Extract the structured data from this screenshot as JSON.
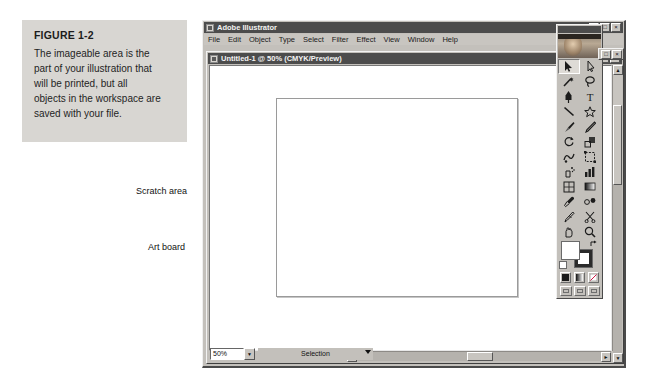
{
  "figure": {
    "title": "FIGURE 1-2",
    "lines": [
      "The imageable area is the",
      "part of your illustration that",
      "will be printed, but all",
      "objects in the workspace are",
      "saved with your file."
    ]
  },
  "callouts": {
    "scratch_area": "Scratch area",
    "art_board": "Art board"
  },
  "app_window": {
    "title": "Adobe Illustrator",
    "icon": "app-icon",
    "buttons": {
      "minimize": "_",
      "maximize": "□",
      "close": "×"
    },
    "menus": [
      "File",
      "Edit",
      "Object",
      "Type",
      "Select",
      "Filter",
      "Effect",
      "View",
      "Window",
      "Help"
    ]
  },
  "document_window": {
    "title": "Untitled-1 @ 50% (CMYK/Preview)",
    "icon": "document-icon",
    "buttons": {
      "minimize": "_",
      "maximize": "□",
      "close": "×"
    }
  },
  "status_bar": {
    "zoom_value": "50%",
    "zoom_placeholder": "50%",
    "status_text": "Selection"
  },
  "scrollbars": {
    "up_arrow": "▲",
    "down_arrow": "▼",
    "left_arrow": "◄",
    "right_arrow": "►"
  },
  "toolbox": {
    "tools": [
      "selection-tool",
      "direct-selection-tool",
      "magic-wand-tool",
      "lasso-tool",
      "pen-tool",
      "type-tool",
      "line-segment-tool",
      "star-shape-tool",
      "paintbrush-tool",
      "pencil-tool",
      "rotate-tool",
      "scale-tool",
      "warp-tool",
      "free-transform-tool",
      "symbol-sprayer-tool",
      "column-graph-tool",
      "mesh-tool",
      "gradient-tool",
      "eyedropper-tool",
      "blend-tool",
      "slice-tool",
      "scissors-tool",
      "hand-tool",
      "zoom-tool"
    ],
    "color_controls": {
      "fill": "fill-swatch",
      "stroke": "stroke-swatch",
      "swap": "swap-fill-stroke-icon",
      "default": "default-fill-stroke-icon"
    },
    "paint_modes": [
      "color-mode",
      "gradient-mode",
      "none-mode"
    ],
    "screen_modes": [
      "standard-screen-mode",
      "full-screen-with-menu",
      "full-screen-mode"
    ]
  }
}
